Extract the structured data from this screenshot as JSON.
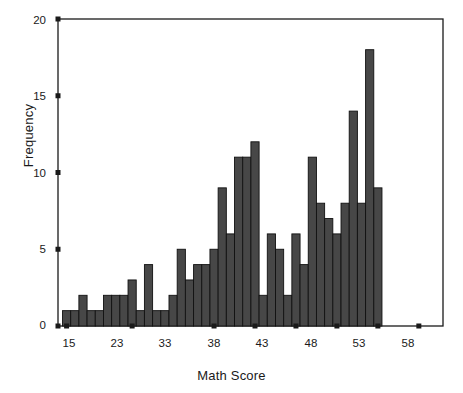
{
  "chart_data": {
    "type": "bar",
    "title": "",
    "subtitle": "",
    "xlabel": "Math Score",
    "ylabel": "Frequency",
    "grid": false,
    "legend": "none",
    "xlim": [
      14,
      61
    ],
    "ylim": [
      0,
      20
    ],
    "ytick_labels": [
      "0",
      "5",
      "10",
      "15",
      "20"
    ],
    "ytick_values": [
      0,
      5,
      10,
      15,
      20
    ],
    "xtick_labels": [
      "15",
      "23",
      "33",
      "38",
      "43",
      "48",
      "53",
      "58"
    ],
    "xtick_values": [
      15,
      23,
      33,
      38,
      43,
      48,
      53,
      58
    ],
    "bar_color": "#474747",
    "bar_edge_color": "#111111",
    "axis_color": "#1a1a1a",
    "categories": [
      "15",
      "16",
      "17",
      "18",
      "19",
      "20",
      "21",
      "22",
      "23",
      "24",
      "25",
      "26",
      "27",
      "28",
      "29",
      "30",
      "31",
      "32",
      "33",
      "34",
      "35",
      "36",
      "37",
      "38",
      "39",
      "40",
      "41",
      "42",
      "43",
      "44",
      "45",
      "46",
      "47",
      "48",
      "49",
      "50",
      "51",
      "52",
      "53",
      "54",
      "55",
      "56",
      "57",
      "58",
      "59",
      "60"
    ],
    "values": [
      1,
      1,
      2,
      1,
      1,
      2,
      2,
      2,
      3,
      1,
      4,
      1,
      1,
      2,
      5,
      3,
      4,
      4,
      5,
      9,
      6,
      11,
      11,
      12,
      2,
      6,
      5,
      2,
      6,
      4,
      11,
      8,
      7,
      6,
      8,
      14,
      8,
      18,
      9,
      0,
      0,
      0,
      0,
      0,
      0,
      0
    ]
  }
}
